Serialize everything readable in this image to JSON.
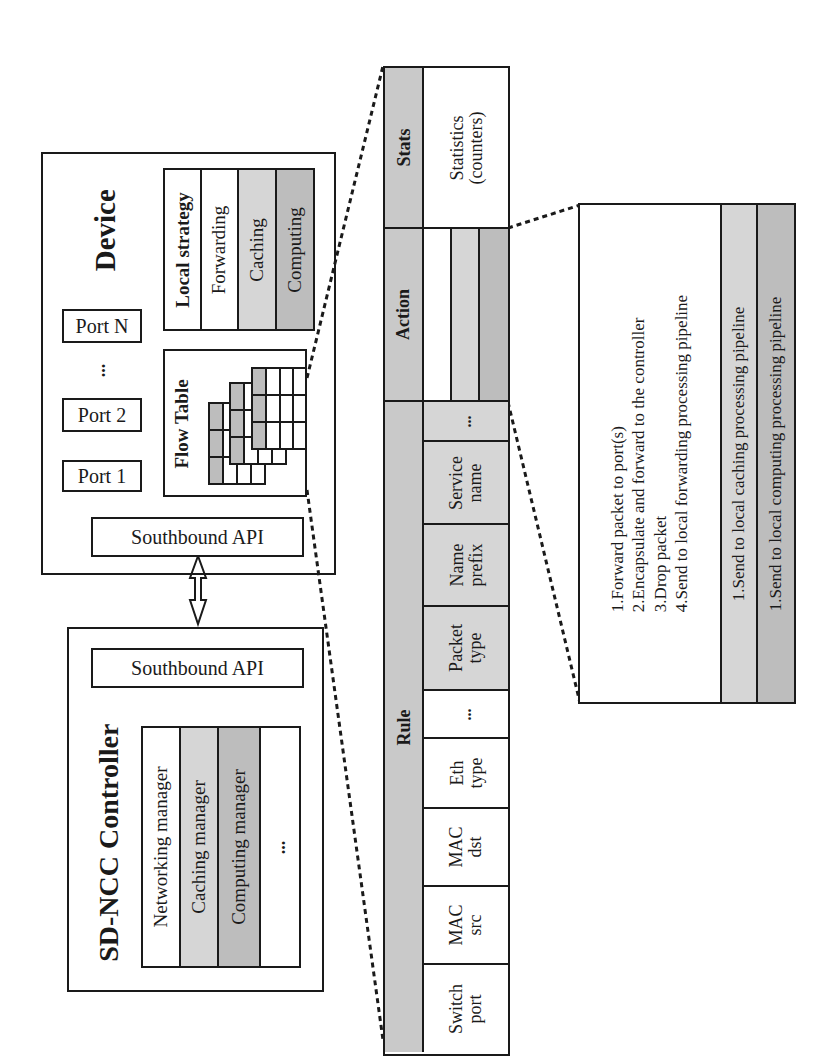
{
  "device": {
    "title": "Device",
    "ports": [
      "Port 1",
      "Port 2",
      "Port N"
    ],
    "port_ellipsis": "...",
    "flow_table_label": "Flow Table",
    "southbound_api": "Southbound API",
    "local_strategy": {
      "title": "Local strategy",
      "items": [
        "Forwarding",
        "Caching",
        "Computing"
      ]
    }
  },
  "controller": {
    "title": "SD-NCC Controller",
    "southbound_api": "Southbound API",
    "managers": [
      "Networking manager",
      "Caching manager",
      "Computing manager",
      "..."
    ]
  },
  "flow_entry": {
    "sections": {
      "rule": "Rule",
      "action": "Action",
      "stats": "Stats"
    },
    "rule_fields": [
      {
        "l1": "Switch",
        "l2": "port"
      },
      {
        "l1": "MAC",
        "l2": "src"
      },
      {
        "l1": "MAC",
        "l2": "dst"
      },
      {
        "l1": "Eth",
        "l2": "type"
      },
      {
        "l1": "...",
        "l2": ""
      },
      {
        "l1": "Packet",
        "l2": "type"
      },
      {
        "l1": "Name",
        "l2": "prefix"
      },
      {
        "l1": "Service",
        "l2": "name"
      },
      {
        "l1": "...",
        "l2": ""
      }
    ],
    "stats_value": {
      "l1": "Statistics",
      "l2": "(counters)"
    }
  },
  "actions": {
    "forwarding": [
      "1.Forward packet to port(s)",
      "2.Encapsulate and forward to the controller",
      "3.Drop packet",
      "4.Send to local forwarding processing pipeline"
    ],
    "caching": "1.Send to local caching processing pipeline",
    "computing": "1.Send to local computing processing pipeline"
  },
  "colors": {
    "border": "#1a1a1a",
    "light_gray": "#d6d6d6",
    "mid_gray": "#c9c9c9",
    "dark_gray": "#bdbdbd"
  }
}
